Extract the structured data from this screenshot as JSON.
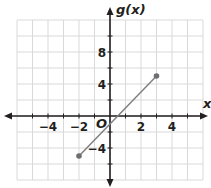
{
  "chart_data": {
    "type": "line",
    "title": "",
    "xlabel": "x",
    "ylabel": "g(x)",
    "origin_label": "O",
    "xlim": [
      -6,
      6
    ],
    "ylim": [
      -8,
      12
    ],
    "x_grid_step": 1,
    "y_grid_step": 2,
    "grid": true,
    "x_tick_labels": [
      {
        "value": -4,
        "label": "−4"
      },
      {
        "value": -2,
        "label": "−2"
      },
      {
        "value": 2,
        "label": "2"
      },
      {
        "value": 4,
        "label": "4"
      }
    ],
    "y_tick_labels": [
      {
        "value": 8,
        "label": "8"
      },
      {
        "value": 4,
        "label": "4"
      },
      {
        "value": -4,
        "label": "−4"
      }
    ],
    "series": [
      {
        "name": "g(x)",
        "points": [
          {
            "x": -2,
            "y": -5
          },
          {
            "x": 3,
            "y": 5
          }
        ],
        "endpoints": "closed",
        "color": "#808080"
      }
    ],
    "colors": {
      "grid": "#d9d9d9",
      "axis": "#231f20",
      "segment": "#808080",
      "point": "#6d6e71"
    }
  }
}
